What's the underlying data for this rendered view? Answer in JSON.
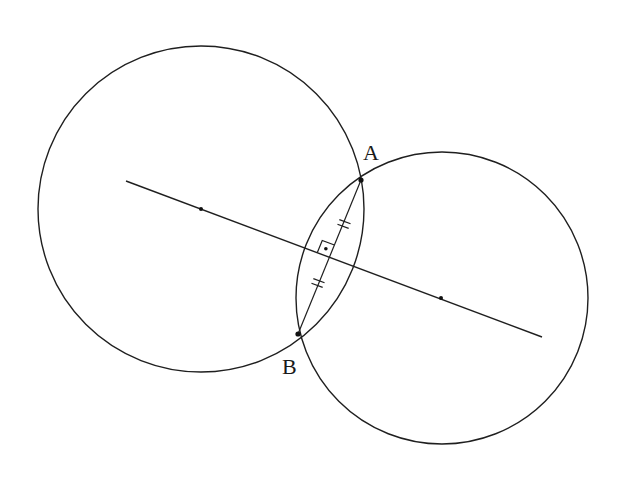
{
  "diagram": {
    "colors": {
      "background": "#ffffff",
      "ink": "#1f1f1f"
    },
    "circles": [
      {
        "name": "left-circle",
        "cx": 201,
        "cy": 209,
        "r": 163
      },
      {
        "name": "right-circle",
        "cx": 442,
        "cy": 298,
        "r": 146
      }
    ],
    "center_line": {
      "x1": 126,
      "y1": 181,
      "x2": 542,
      "y2": 337
    },
    "centers": [
      {
        "name": "left-center",
        "x": 201,
        "y": 209
      },
      {
        "name": "right-center",
        "x": 441,
        "y": 298
      }
    ],
    "points": [
      {
        "name": "A",
        "label": "A",
        "x": 361,
        "y": 180,
        "label_x": 363,
        "label_y": 160
      },
      {
        "name": "B",
        "label": "B",
        "x": 298,
        "y": 334,
        "label_x": 282,
        "label_y": 374
      }
    ],
    "chord": {
      "from": "A",
      "to": "B"
    },
    "equal_marks": [
      {
        "name": "tick-upper",
        "x": 344,
        "y": 224,
        "count": 2
      },
      {
        "name": "tick-lower",
        "x": 318,
        "y": 283,
        "count": 2
      }
    ],
    "right_angle": {
      "x": 329.5,
      "y": 257,
      "size": 13,
      "dot": true
    },
    "labels": {
      "A": "A",
      "B": "B"
    }
  }
}
